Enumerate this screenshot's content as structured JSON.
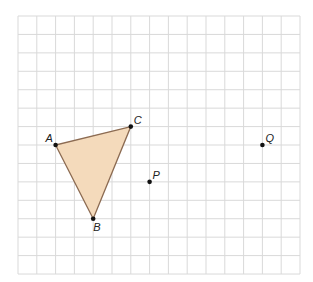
{
  "diagram": {
    "grid": {
      "origin_x": 18,
      "origin_y": 16,
      "cell_w": 18.8,
      "cell_h": 18.43,
      "columns": 15,
      "rows": 14,
      "line_color": "#d9d9d9"
    },
    "triangle": {
      "vertices": [
        "A",
        "B",
        "C"
      ],
      "fill": "#f4dabb",
      "stroke": "#8c6b52"
    },
    "points": [
      {
        "label": "A",
        "col": 2,
        "row": 7,
        "label_dx": -10,
        "label_dy": -3
      },
      {
        "label": "C",
        "col": 6,
        "row": 6,
        "label_dx": 3,
        "label_dy": -3
      },
      {
        "label": "B",
        "col": 4,
        "row": 11,
        "label_dx": 0,
        "label_dy": 12
      },
      {
        "label": "P",
        "col": 7,
        "row": 9,
        "label_dx": 3,
        "label_dy": -3
      },
      {
        "label": "Q",
        "col": 13,
        "row": 7,
        "label_dx": 3,
        "label_dy": -3
      }
    ]
  }
}
